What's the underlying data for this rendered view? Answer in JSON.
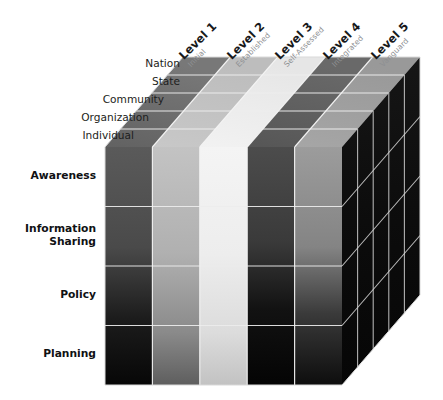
{
  "diagram": {
    "type": "3d-cube-matrix",
    "axes": {
      "columns_axis_name": "Maturity Level",
      "depth_axis_name": "Scope",
      "rows_axis_name": "Dimension"
    },
    "columns": [
      {
        "index": 1,
        "label": "Level 1",
        "sublabel": "Initial"
      },
      {
        "index": 2,
        "label": "Level 2",
        "sublabel": "Established"
      },
      {
        "index": 3,
        "label": "Level 3",
        "sublabel": "Self-Assessed"
      },
      {
        "index": 4,
        "label": "Level 4",
        "sublabel": "Integrated"
      },
      {
        "index": 5,
        "label": "Level 5",
        "sublabel": "Vanguard"
      }
    ],
    "depth_labels": [
      {
        "index": 1,
        "label": "Nation"
      },
      {
        "index": 2,
        "label": "State"
      },
      {
        "index": 3,
        "label": "Community"
      },
      {
        "index": 4,
        "label": "Organization"
      },
      {
        "index": 5,
        "label": "Individual"
      }
    ],
    "rows": [
      {
        "index": 1,
        "label": "Awareness"
      },
      {
        "index": 2,
        "label": "Information\nSharing"
      },
      {
        "index": 3,
        "label": "Policy"
      },
      {
        "index": 4,
        "label": "Planning"
      }
    ],
    "colors": {
      "background": "#ffffff",
      "grid_line": "#e8e8e8",
      "side_face": "#0d0d0d",
      "label_text": "#17181a",
      "sublabel_text": "#8e9093",
      "column_top_tones": [
        "#585858",
        "#c0c0c0",
        "#f2f2f2",
        "#4a4a4a",
        "#9a9a9a"
      ],
      "column_bottom_tones": [
        "#0a0a0a",
        "#6a6a6a",
        "#c8c8c8",
        "#050505",
        "#121212"
      ],
      "top_face_tones": [
        "#6d6d6d",
        "#c6c6c6",
        "#efefef",
        "#5c5c5c",
        "#a2a2a2"
      ]
    }
  }
}
